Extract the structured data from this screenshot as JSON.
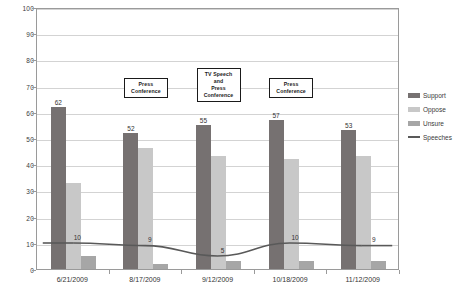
{
  "chart_data": {
    "type": "bar",
    "title": "",
    "subtitle": "",
    "xlabel": "",
    "ylabel": "",
    "ylim": [
      0,
      100
    ],
    "ytick_labels": [
      "0",
      "10",
      "20",
      "30",
      "40",
      "50",
      "60",
      "70",
      "80",
      "90",
      "100"
    ],
    "ytick_values": [
      0,
      10,
      20,
      30,
      40,
      50,
      60,
      70,
      80,
      90,
      100
    ],
    "grid": true,
    "legend_position": "right",
    "categories": [
      "6/21/2009",
      "8/17/2009",
      "9/12/2009",
      "10/18/2009",
      "11/12/2009"
    ],
    "series": [
      {
        "name": "Support",
        "type": "bar",
        "color": "#767171",
        "values": [
          62,
          52,
          55,
          57,
          53
        ],
        "labels": [
          "62",
          "52",
          "55",
          "57",
          "53"
        ]
      },
      {
        "name": "Oppose",
        "type": "bar",
        "color": "#c8c8c8",
        "values": [
          33,
          46,
          43,
          42,
          43
        ],
        "labels": [
          "",
          "",
          "",
          "",
          ""
        ]
      },
      {
        "name": "Unsure",
        "type": "bar",
        "color": "#a6a6a6",
        "values": [
          5,
          2,
          3,
          3,
          3
        ],
        "labels": [
          "",
          "",
          "",
          "",
          ""
        ]
      },
      {
        "name": "Speeches",
        "type": "line",
        "color": "#595959",
        "values": [
          10,
          9,
          5,
          10,
          9
        ],
        "labels": [
          "10",
          "9",
          "5",
          "10",
          "9"
        ]
      }
    ],
    "annotations": [
      {
        "text": "Press\nConference",
        "near_category": "8/17/2009",
        "value": 70
      },
      {
        "text": "TV Speech\nand\nPress\nConference",
        "near_category": "9/12/2009",
        "value": 71
      },
      {
        "text": "Press\nConference",
        "near_category": "10/18/2009",
        "value": 70
      }
    ]
  },
  "legend": {
    "items": [
      {
        "label": "Support",
        "color": "#767171",
        "marker": "swatch"
      },
      {
        "label": "Oppose",
        "color": "#c8c8c8",
        "marker": "swatch"
      },
      {
        "label": "Unsure",
        "color": "#a6a6a6",
        "marker": "swatch"
      },
      {
        "label": "Speeches",
        "color": "#595959",
        "marker": "line"
      }
    ]
  }
}
